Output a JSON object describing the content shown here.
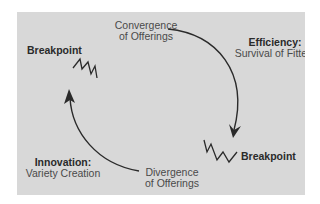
{
  "diagram": {
    "top_label": {
      "line1": "Convergence",
      "line2": "of Offerings"
    },
    "bottom_label": {
      "line1": "Divergence",
      "line2": "of Offerings"
    },
    "right_label": {
      "title": "Efficiency:",
      "subtitle": "Survival of Fittest"
    },
    "left_label": {
      "title": "Innovation:",
      "subtitle": "Variety Creation"
    },
    "breakpoint_top_left": "Breakpoint",
    "breakpoint_bottom_right": "Breakpoint",
    "colors": {
      "panel": "#d8d8d8",
      "line": "#2a2a2a",
      "text": "#4a4a4a",
      "bold_text": "#2a2a2a"
    }
  }
}
